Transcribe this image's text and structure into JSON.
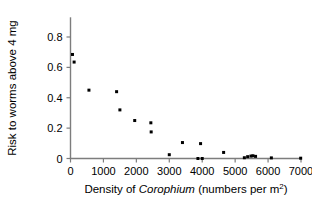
{
  "chart_data": {
    "type": "scatter",
    "title": "",
    "xlabel": "Density of Corophium (numbers per m2)",
    "xlabel_parts": {
      "prefix": "Density of ",
      "italic": "Corophium",
      "suffix": " (numbers per m",
      "superscript": "2",
      "tail": ")"
    },
    "ylabel": "Risk to worms above 4 mg",
    "xlim": [
      0,
      7000
    ],
    "ylim": [
      0,
      0.88
    ],
    "xticks": [
      0,
      1000,
      2000,
      3000,
      4000,
      5000,
      6000,
      7000
    ],
    "xtick_labels": [
      "0",
      "1000",
      "2000",
      "3000",
      "4000",
      "5000",
      "6000",
      "7000"
    ],
    "yticks": [
      0,
      0.2,
      0.4,
      0.6,
      0.8
    ],
    "ytick_labels": [
      "0",
      "0.2",
      "0.4",
      "0.6",
      "0.8"
    ],
    "grid": false,
    "legend": null,
    "marker": {
      "shape": "square",
      "color": "#000000",
      "size_px": 3
    },
    "points": [
      {
        "x": 60,
        "y": 0.685
      },
      {
        "x": 110,
        "y": 0.635
      },
      {
        "x": 560,
        "y": 0.45
      },
      {
        "x": 1400,
        "y": 0.44
      },
      {
        "x": 1500,
        "y": 0.32
      },
      {
        "x": 1950,
        "y": 0.25
      },
      {
        "x": 2440,
        "y": 0.235
      },
      {
        "x": 2450,
        "y": 0.175
      },
      {
        "x": 3000,
        "y": 0.025
      },
      {
        "x": 3400,
        "y": 0.105
      },
      {
        "x": 3870,
        "y": 0.0
      },
      {
        "x": 3950,
        "y": 0.098
      },
      {
        "x": 4000,
        "y": 0.0
      },
      {
        "x": 4650,
        "y": 0.04
      },
      {
        "x": 5280,
        "y": 0.005
      },
      {
        "x": 5380,
        "y": 0.012
      },
      {
        "x": 5480,
        "y": 0.016
      },
      {
        "x": 5540,
        "y": 0.018
      },
      {
        "x": 5620,
        "y": 0.014
      },
      {
        "x": 6100,
        "y": 0.004
      },
      {
        "x": 6990,
        "y": 0.002
      }
    ]
  }
}
